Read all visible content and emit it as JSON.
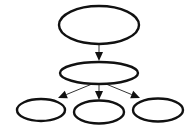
{
  "diagram": {
    "type": "tree",
    "canvas": {
      "width": 194,
      "height": 128,
      "background": "#ffffff"
    },
    "colors": {
      "node_stroke": "#111111",
      "edge_line": "#333333",
      "arrow_head": "#111111"
    },
    "nodes": [
      {
        "id": "root",
        "label": "",
        "cx": 99,
        "cy": 25,
        "rx": 40,
        "ry": 19
      },
      {
        "id": "middle",
        "label": "",
        "cx": 99,
        "cy": 73,
        "rx": 39,
        "ry": 11
      },
      {
        "id": "left",
        "label": "",
        "cx": 41,
        "cy": 110,
        "rx": 24,
        "ry": 11
      },
      {
        "id": "center",
        "label": "",
        "cx": 99,
        "cy": 112,
        "rx": 25,
        "ry": 11.5
      },
      {
        "id": "right",
        "label": "",
        "cx": 158,
        "cy": 110,
        "rx": 25,
        "ry": 11.5
      }
    ],
    "edges": [
      {
        "from": "root",
        "to": "middle",
        "x1": 99,
        "y1": 44,
        "x2": 99,
        "y2": 61
      },
      {
        "from": "middle",
        "to": "left",
        "x1": 92,
        "y1": 84,
        "x2": 58,
        "y2": 98
      },
      {
        "from": "middle",
        "to": "center",
        "x1": 99,
        "y1": 84,
        "x2": 99,
        "y2": 100
      },
      {
        "from": "middle",
        "to": "right",
        "x1": 106,
        "y1": 84,
        "x2": 140,
        "y2": 98
      }
    ]
  }
}
